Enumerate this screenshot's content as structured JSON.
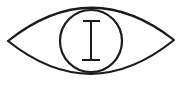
{
  "icon": {
    "name": "eye-icon",
    "description": "Eye outline with a circular iris containing an I-beam glyph",
    "stroke_color": "#1a1a1a",
    "background_color": "#ffffff",
    "iris_glyph": "I"
  }
}
